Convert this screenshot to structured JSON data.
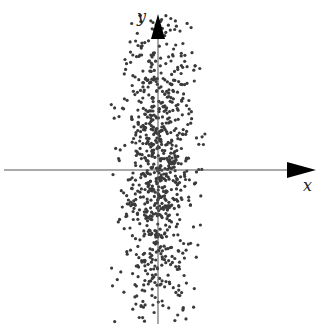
{
  "chart_data": {
    "type": "scatter",
    "title": "",
    "xlabel": "x",
    "ylabel": "y",
    "grid": false,
    "legend": null,
    "distribution": {
      "n_points": 900,
      "center": [
        0,
        0
      ],
      "std_x": 0.35,
      "std_y": 1.55,
      "correlation": 0.05
    },
    "axes": {
      "origin_px": [
        158,
        170
      ],
      "x_axis": {
        "from_px": 4,
        "to_px": 316
      },
      "y_axis": {
        "from_px": 324,
        "to_px": 14
      },
      "unit_px": 52,
      "arrow_color": "#000000",
      "line_color": "#555555"
    },
    "point_style": {
      "radius": 1.6,
      "color": "#3a3a3a"
    }
  }
}
